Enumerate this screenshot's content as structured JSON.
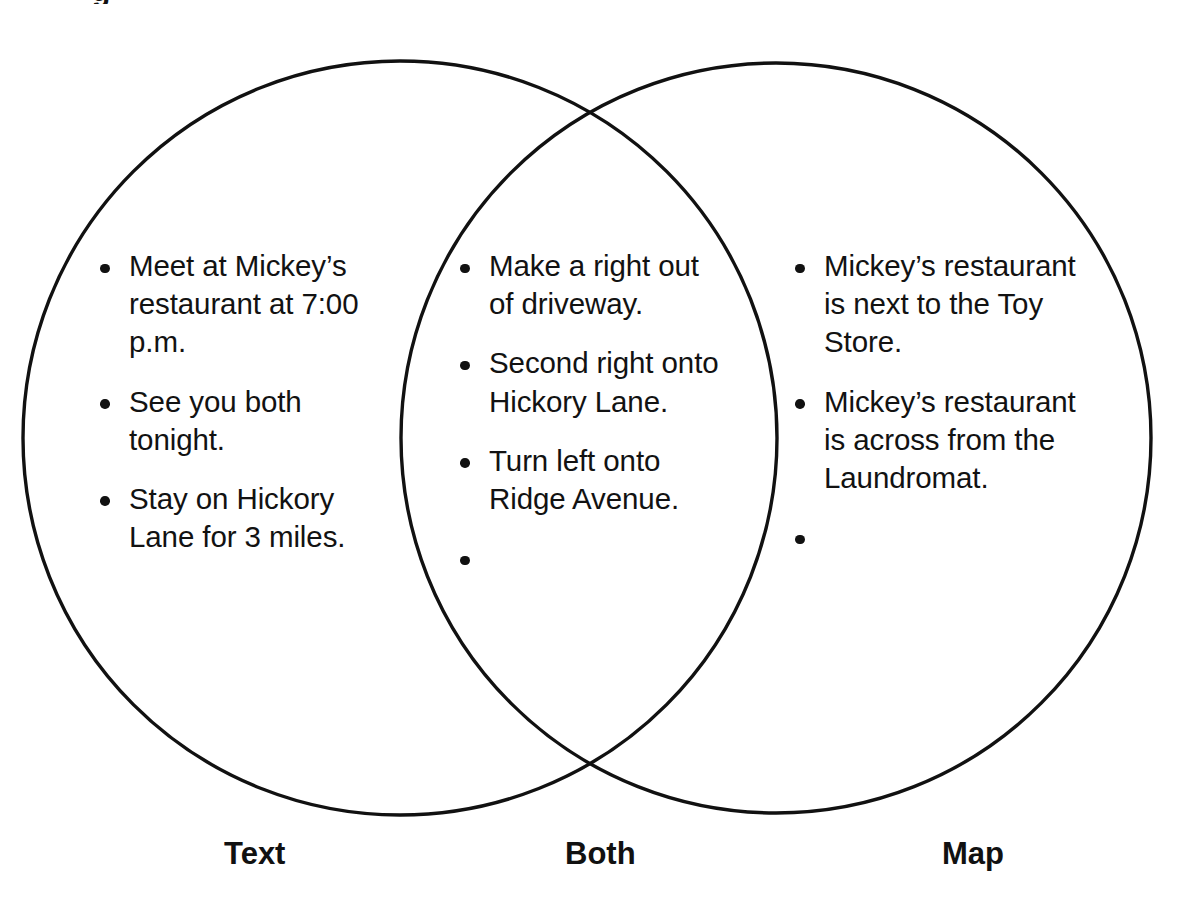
{
  "diagram": {
    "type": "venn",
    "title_fragment_cropped": "g",
    "stroke_color": "#111111",
    "background_color": "#ffffff",
    "circles": [
      {
        "name": "Text",
        "cx": 400,
        "cy": 438,
        "r": 377
      },
      {
        "name": "Map",
        "cx": 776,
        "cy": 438,
        "r": 375
      }
    ],
    "labels": [
      {
        "id": "text",
        "text": "Text"
      },
      {
        "id": "both",
        "text": "Both"
      },
      {
        "id": "map",
        "text": "Map"
      }
    ],
    "regions": {
      "left": {
        "label": "Text",
        "items": [
          "Meet at Mickey’s restaurant at 7:00 p.m.",
          "See you both tonight.",
          "Stay on Hickory Lane for 3 miles."
        ]
      },
      "middle": {
        "label": "Both",
        "items": [
          "Make a right out of driveway.",
          "Second right onto Hickory Lane.",
          "Turn left onto Ridge Avenue.",
          ""
        ]
      },
      "right": {
        "label": "Map",
        "items": [
          "Mickey’s restaurant is next to the Toy Store.",
          "Mickey’s restaurant is across from the Laundromat.",
          ""
        ]
      }
    }
  }
}
